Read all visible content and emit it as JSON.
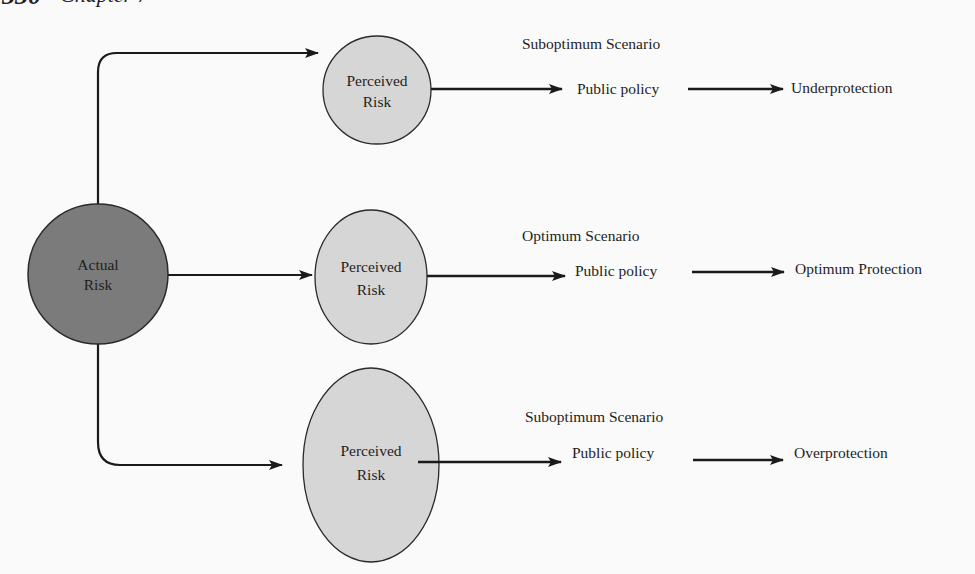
{
  "header": {
    "page_number": "330",
    "chapter": "Chapter 7"
  },
  "colors": {
    "actual_fill": "#7b7b7b",
    "perceived_fill": "#d6d6d6",
    "stroke": "#1a1a1a",
    "text": "#1e1e1e"
  },
  "nodes": {
    "actual": {
      "line1": "Actual",
      "line2": "Risk"
    },
    "perceived": [
      {
        "line1": "Perceived",
        "line2": "Risk",
        "size": "small"
      },
      {
        "line1": "Perceived",
        "line2": "Risk",
        "size": "medium"
      },
      {
        "line1": "Perceived",
        "line2": "Risk",
        "size": "large"
      }
    ]
  },
  "rows": [
    {
      "scenario": "Suboptimum Scenario",
      "policy": "Public policy",
      "outcome": "Underprotection"
    },
    {
      "scenario": "Optimum Scenario",
      "policy": "Public policy",
      "outcome": "Optimum Protection"
    },
    {
      "scenario": "Suboptimum Scenario",
      "policy": "Public policy",
      "outcome": "Overprotection"
    }
  ]
}
